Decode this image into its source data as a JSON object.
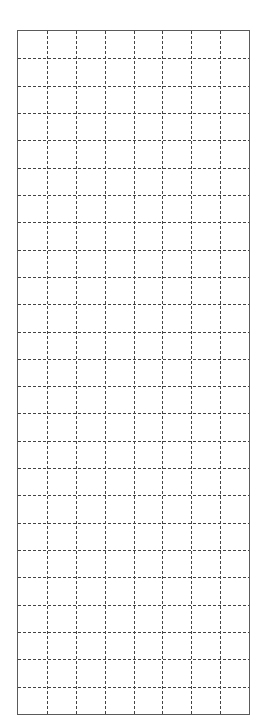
{
  "grid": {
    "columns": 8,
    "rows": 25,
    "border_color": "#5a5a5a",
    "line_color": "#444444",
    "line_style": "dashed",
    "dash_pattern": [
      3,
      2
    ],
    "background": "#ffffff"
  }
}
